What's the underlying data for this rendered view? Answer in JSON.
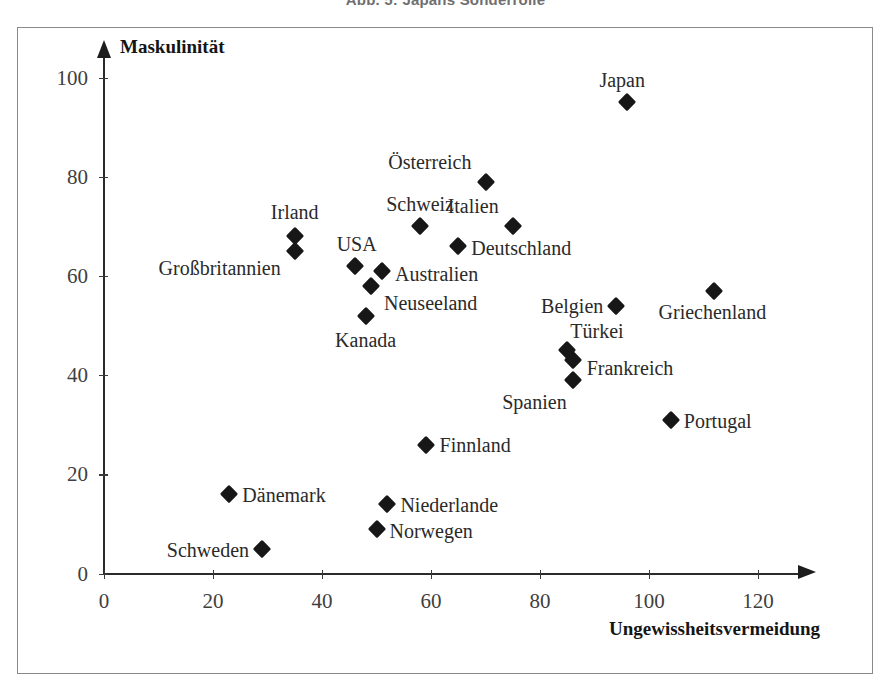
{
  "figure": {
    "caption": "Abb. 5: Japans Sonderrolle"
  },
  "chart_data": {
    "type": "scatter",
    "title": "Abb. 5: Japans Sonderrolle",
    "xlabel": "Ungewissheitsvermeidung",
    "ylabel": "Maskulinität",
    "xlim": [
      0,
      130
    ],
    "ylim": [
      0,
      108
    ],
    "xticks": [
      0,
      20,
      40,
      60,
      80,
      100,
      120
    ],
    "yticks": [
      0,
      20,
      40,
      60,
      80,
      100
    ],
    "grid": false,
    "legend": "none",
    "marker": "diamond",
    "marker_color": "#171717",
    "points": [
      {
        "label": "Japan",
        "x": 96,
        "y": 95,
        "label_dx": -5,
        "label_dy": -22,
        "align": "middle"
      },
      {
        "label": "Österreich",
        "x": 70,
        "y": 79,
        "label_dx": -14,
        "label_dy": -20,
        "align": "end"
      },
      {
        "label": "Italien",
        "x": 75,
        "y": 70,
        "label_dx": -14,
        "label_dy": -20,
        "align": "end"
      },
      {
        "label": "Schweiz",
        "x": 58,
        "y": 70,
        "label_dx": 0,
        "label_dy": -22,
        "align": "middle"
      },
      {
        "label": "Irland",
        "x": 35,
        "y": 68,
        "label_dx": 0,
        "label_dy": -24,
        "align": "middle"
      },
      {
        "label": "Großbritannien",
        "x": 35,
        "y": 65,
        "label_dx": -14,
        "label_dy": 17,
        "align": "end"
      },
      {
        "label": "Deutschland",
        "x": 65,
        "y": 66,
        "label_dx": 13,
        "label_dy": 2,
        "align": "start"
      },
      {
        "label": "USA",
        "x": 46,
        "y": 62,
        "label_dx": 2,
        "label_dy": -22,
        "align": "middle"
      },
      {
        "label": "Australien",
        "x": 51,
        "y": 61,
        "label_dx": 13,
        "label_dy": 3,
        "align": "start"
      },
      {
        "label": "Neuseeland",
        "x": 49,
        "y": 58,
        "label_dx": 13,
        "label_dy": 17,
        "align": "start"
      },
      {
        "label": "Griechenland",
        "x": 112,
        "y": 57,
        "label_dx": -2,
        "label_dy": 21,
        "align": "middle"
      },
      {
        "label": "Belgien",
        "x": 94,
        "y": 54,
        "label_dx": -13,
        "label_dy": 0,
        "align": "end"
      },
      {
        "label": "Kanada",
        "x": 48,
        "y": 52,
        "label_dx": 0,
        "label_dy": 24,
        "align": "middle"
      },
      {
        "label": "Türkei",
        "x": 85,
        "y": 45,
        "label_dx": 3,
        "label_dy": -19,
        "align": "start"
      },
      {
        "label": "Frankreich",
        "x": 86,
        "y": 43,
        "label_dx": 14,
        "label_dy": 8,
        "align": "start"
      },
      {
        "label": "Spanien",
        "x": 86,
        "y": 39,
        "label_dx": -6,
        "label_dy": 22,
        "align": "end"
      },
      {
        "label": "Portugal",
        "x": 104,
        "y": 31,
        "label_dx": 13,
        "label_dy": 1,
        "align": "start"
      },
      {
        "label": "Finnland",
        "x": 59,
        "y": 26,
        "label_dx": 14,
        "label_dy": 0,
        "align": "start"
      },
      {
        "label": "Dänemark",
        "x": 23,
        "y": 16,
        "label_dx": 13,
        "label_dy": 1,
        "align": "start"
      },
      {
        "label": "Niederlande",
        "x": 52,
        "y": 14,
        "label_dx": 13,
        "label_dy": 1,
        "align": "start"
      },
      {
        "label": "Norwegen",
        "x": 50,
        "y": 9,
        "label_dx": 13,
        "label_dy": 2,
        "align": "start"
      },
      {
        "label": "Schweden",
        "x": 29,
        "y": 5,
        "label_dx": -13,
        "label_dy": 1,
        "align": "end"
      }
    ]
  }
}
